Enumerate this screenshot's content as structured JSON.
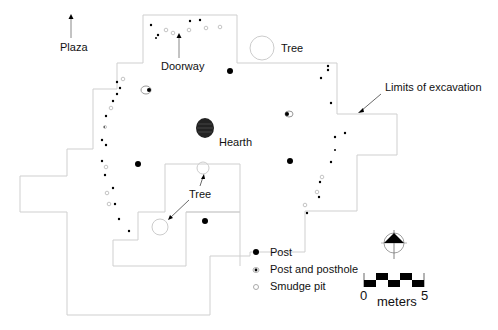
{
  "labels": {
    "plaza": "Plaza",
    "doorway": "Doorway",
    "tree_top": "Tree",
    "tree_bottom": "Tree",
    "hearth": "Hearth",
    "limits": "Limits of excavation"
  },
  "legend": {
    "items": [
      {
        "symbol": "filled-circle",
        "label": "Post"
      },
      {
        "symbol": "dotted-circle",
        "label": "Post and posthole"
      },
      {
        "symbol": "open-circle",
        "label": "Smudge pit"
      }
    ]
  },
  "scale": {
    "start": "0",
    "end": "5",
    "unit": "meters"
  },
  "north_arrow": "north-arrow",
  "colors": {
    "boundary": "#c8c8c8",
    "feature": "#000000",
    "smudge": "#bdbdbd"
  }
}
